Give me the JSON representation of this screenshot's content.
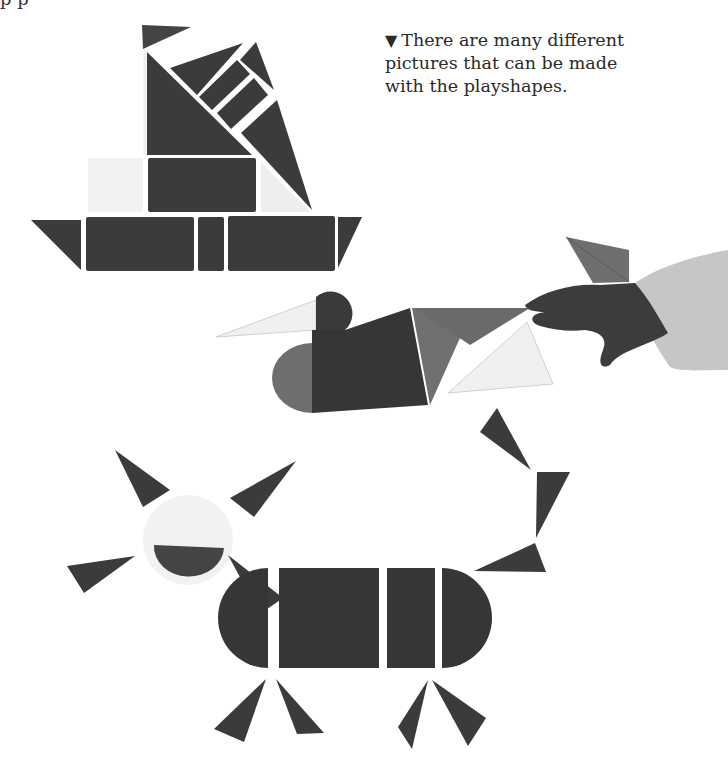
{
  "page": {
    "top_cut_text": "p                                         p",
    "caption": {
      "marker": "▼",
      "lines": [
        "There are many different",
        "pictures that can be made",
        "with the playshapes."
      ]
    }
  },
  "figures": [
    {
      "name": "sailboat",
      "description": "Boat built from triangles and rectangles"
    },
    {
      "name": "duck",
      "description": "Duck built from semicircles, triangles and a quarter shape, being arranged by a child's hand"
    },
    {
      "name": "cat",
      "description": "Cat built from circle head, semicircles, rectangles and triangles"
    }
  ],
  "colors": {
    "background": "#ffffff",
    "dark_piece": "#3a3a3a",
    "mid_piece": "#6f6f6f",
    "light_piece": "#f1f1f1",
    "sleeve": "#c6c6c6",
    "hand": "#3c3c3c",
    "text": "#2a2a2a"
  }
}
